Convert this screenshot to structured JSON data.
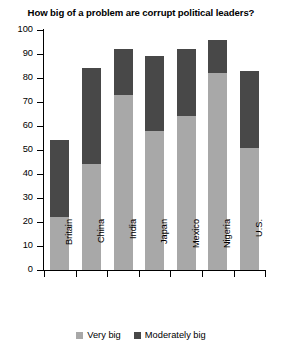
{
  "chart_data": {
    "type": "bar",
    "stacked": true,
    "title": "How big of a problem are corrupt political leaders?",
    "xlabel": "",
    "ylabel": "",
    "ylim": [
      0,
      100
    ],
    "yticks": [
      0,
      10,
      20,
      30,
      40,
      50,
      60,
      70,
      80,
      90,
      100
    ],
    "grid": false,
    "legend_position": "bottom",
    "categories": [
      "Britain",
      "China",
      "India",
      "Japan",
      "Mexico",
      "Nigeria",
      "U.S."
    ],
    "series": [
      {
        "name": "Very big",
        "color": "#a8a8a8",
        "values": [
          22,
          44,
          73,
          58,
          64,
          82,
          51
        ]
      },
      {
        "name": "Moderately big",
        "color": "#484848",
        "values": [
          32,
          40,
          19,
          31,
          28,
          14,
          32
        ]
      }
    ],
    "totals": [
      54,
      84,
      92,
      89,
      92,
      96,
      83
    ]
  },
  "legend": {
    "items": [
      {
        "label": "Very big",
        "color": "#a8a8a8"
      },
      {
        "label": "Moderately big",
        "color": "#484848"
      }
    ]
  }
}
